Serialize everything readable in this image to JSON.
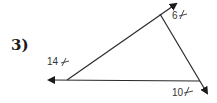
{
  "problem": {
    "number_label": "3)"
  },
  "diagram": {
    "angles": [
      {
        "id": "left",
        "value": "14",
        "symbol": "angle-symbol"
      },
      {
        "id": "top",
        "value": "6",
        "symbol": "angle-symbol"
      },
      {
        "id": "bottom-right",
        "value": "10",
        "symbol": "angle-symbol"
      }
    ],
    "colors": {
      "line": "#2a2a2a",
      "text": "#333333",
      "background": "#ffffff"
    }
  }
}
